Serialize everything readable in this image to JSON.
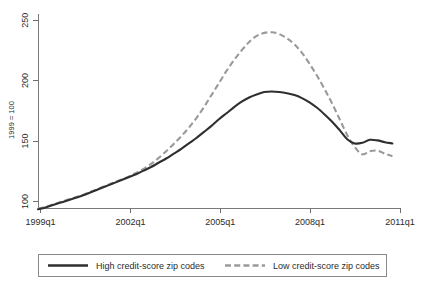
{
  "chart_data": {
    "type": "line",
    "title": "",
    "subtitle": "",
    "xlabel": "",
    "ylabel": "1999 = 100",
    "xlim": [
      1999.0,
      2011.0
    ],
    "ylim": [
      85,
      255
    ],
    "grid": false,
    "legend_position": "bottom",
    "x_tick_labels": [
      "1999q1",
      "2002q1",
      "2005q1",
      "2008q1",
      "2011q1"
    ],
    "x_tick_values": [
      1999.0,
      2002.0,
      2005.0,
      2008.0,
      2011.0
    ],
    "y_tick_labels": [
      "100",
      "150",
      "200",
      "250"
    ],
    "y_tick_values": [
      100,
      150,
      200,
      250
    ],
    "x": [
      1999.0,
      1999.25,
      1999.5,
      1999.75,
      2000.0,
      2000.25,
      2000.5,
      2000.75,
      2001.0,
      2001.25,
      2001.5,
      2001.75,
      2002.0,
      2002.25,
      2002.5,
      2002.75,
      2003.0,
      2003.25,
      2003.5,
      2003.75,
      2004.0,
      2004.25,
      2004.5,
      2004.75,
      2005.0,
      2005.25,
      2005.5,
      2005.75,
      2006.0,
      2006.25,
      2006.5,
      2006.75,
      2007.0,
      2007.25,
      2007.5,
      2007.75,
      2008.0,
      2008.25,
      2008.5,
      2008.75,
      2009.0,
      2009.25,
      2009.5,
      2009.75,
      2010.0,
      2010.25,
      2010.5,
      2010.75
    ],
    "series": [
      {
        "name": "High credit-score zip codes",
        "color": "#2f2f2f",
        "style": "solid",
        "values": [
          93.5,
          95.0,
          97.0,
          99.0,
          101.0,
          103.0,
          105.0,
          107.5,
          110.0,
          112.5,
          115.0,
          117.5,
          120.0,
          122.5,
          125.5,
          128.5,
          132.0,
          135.5,
          139.5,
          143.5,
          148.0,
          152.5,
          157.5,
          162.5,
          168.0,
          173.0,
          178.0,
          182.5,
          186.0,
          188.5,
          190.5,
          191.0,
          190.5,
          189.5,
          188.0,
          185.5,
          182.0,
          177.5,
          172.0,
          166.0,
          159.0,
          151.5,
          148.0,
          148.5,
          151.0,
          150.5,
          149.0,
          148.0
        ]
      },
      {
        "name": "Low credit-score zip codes",
        "color": "#9a9a9a",
        "style": "dashed",
        "values": [
          94.0,
          95.5,
          97.5,
          99.5,
          101.5,
          103.5,
          105.5,
          108.0,
          110.5,
          113.0,
          115.5,
          118.0,
          120.5,
          123.5,
          127.0,
          131.0,
          136.0,
          141.5,
          147.5,
          154.0,
          161.0,
          169.0,
          178.0,
          188.0,
          198.0,
          208.0,
          217.0,
          225.0,
          232.0,
          237.0,
          239.5,
          240.0,
          238.5,
          235.0,
          230.0,
          223.0,
          214.0,
          204.0,
          193.0,
          181.0,
          168.0,
          155.0,
          145.0,
          139.0,
          141.5,
          142.0,
          139.5,
          137.5
        ]
      }
    ],
    "legend_entries": [
      {
        "label": "High credit-score zip codes",
        "color": "#2f2f2f",
        "style": "solid"
      },
      {
        "label": "Low credit-score zip codes",
        "color": "#9a9a9a",
        "style": "dashed"
      }
    ]
  }
}
